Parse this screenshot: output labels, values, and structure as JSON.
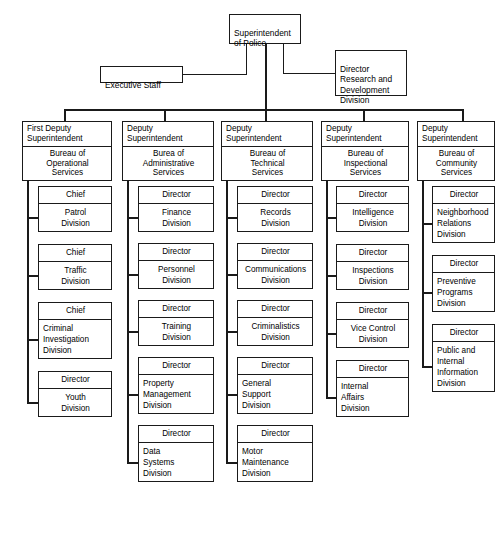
{
  "chart": {
    "type": "organization-chart",
    "root": {
      "label": "Superintendent\nof Police"
    },
    "staff": {
      "label": "Executive Staff"
    },
    "advisory": {
      "label": "Director\nResearch and\nDevelopment\nDivision"
    },
    "bureaus": [
      {
        "head": "First Deputy\nSuperintendent",
        "bureau": "Bureau of\nOperational\nServices",
        "units": [
          {
            "rank": "Chief",
            "division": "Patrol\nDivision"
          },
          {
            "rank": "Chief",
            "division": "Traffic\nDivision"
          },
          {
            "rank": "Chief",
            "division": "Criminal\nInvestigation\nDivision"
          },
          {
            "rank": "Director",
            "division": "Youth\nDivision"
          }
        ]
      },
      {
        "head": "Deputy\nSuperintendent",
        "bureau": "Burea of\nAdministrative\nServices",
        "units": [
          {
            "rank": "Director",
            "division": "Finance\nDivision"
          },
          {
            "rank": "Director",
            "division": "Personnel\nDivision"
          },
          {
            "rank": "Director",
            "division": "Training\nDivision"
          },
          {
            "rank": "Director",
            "division": "Property\nManagement\nDivision"
          },
          {
            "rank": "Director",
            "division": "Data\nSystems\nDivision"
          }
        ]
      },
      {
        "head": "Deputy\nSuperintendent",
        "bureau": "Bureau of\nTechnical\nServices",
        "units": [
          {
            "rank": "Director",
            "division": "Records\nDivision"
          },
          {
            "rank": "Director",
            "division": "Communications\nDivision"
          },
          {
            "rank": "Director",
            "division": "Criminalistics\nDivision"
          },
          {
            "rank": "Director",
            "division": "General\nSupport\nDivision"
          },
          {
            "rank": "Director",
            "division": "Motor\nMaintenance\nDivision"
          }
        ]
      },
      {
        "head": "Deputy\nSuperintendent",
        "bureau": "Bureau of\nInspectional\nServices",
        "units": [
          {
            "rank": "Director",
            "division": "Intelligence\nDivision"
          },
          {
            "rank": "Director",
            "division": "Inspections\nDivision"
          },
          {
            "rank": "Director",
            "division": "Vice Control\nDivision"
          },
          {
            "rank": "Director",
            "division": "Internal\nAffairs\nDivision"
          }
        ]
      },
      {
        "head": "Deputy\nSuperintendent",
        "bureau": "Bureau of\nCommunity\nServices",
        "units": [
          {
            "rank": "Director",
            "division": "Neighborhood\nRelations\nDivision"
          },
          {
            "rank": "Director",
            "division": "Preventive\nPrograms\nDivision"
          },
          {
            "rank": "Director",
            "division": "Public and\nInternal\nInformation\nDivision"
          }
        ]
      }
    ]
  }
}
